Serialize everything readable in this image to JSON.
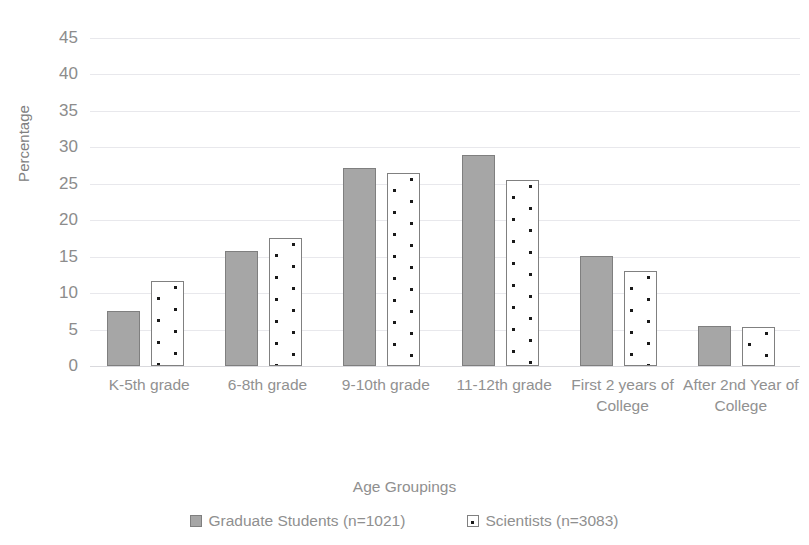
{
  "chart_data": {
    "type": "bar",
    "title": "",
    "xlabel": "Age Groupings",
    "ylabel": "Percentage",
    "ylim": [
      0,
      45
    ],
    "yticks": [
      0,
      5,
      10,
      15,
      20,
      25,
      30,
      35,
      40,
      45
    ],
    "grid": true,
    "legend_position": "bottom",
    "categories": [
      "K-5th grade",
      "6-8th grade",
      "9-10th grade",
      "11-12th grade",
      "First 2 years of College",
      "After 2nd Year of College"
    ],
    "series": [
      {
        "name": "Graduate Students (n=1021)",
        "style": "solid-gray",
        "color": "#A6A6A6",
        "values": [
          7.6,
          15.8,
          27.2,
          29.0,
          15.1,
          5.5
        ]
      },
      {
        "name": "Scientists (n=3083)",
        "style": "white-with-dots",
        "color": "#FFFFFF",
        "values": [
          11.7,
          17.6,
          26.5,
          25.5,
          13.0,
          5.3
        ]
      }
    ]
  },
  "axis": {
    "y_title": "Percentage",
    "x_title": "Age Groupings",
    "y_ticks": [
      "45",
      "40",
      "35",
      "30",
      "25",
      "20",
      "15",
      "10",
      "5",
      "0"
    ]
  },
  "x_labels": [
    "K-5th grade",
    "6-8th grade",
    "9-10th grade",
    "11-12th grade",
    "First 2 years of College",
    "After 2nd Year of College"
  ],
  "legend": {
    "items": [
      {
        "label": "Graduate Students (n=1021)"
      },
      {
        "label": "Scientists (n=3083)"
      }
    ]
  },
  "colors": {
    "series1_fill": "#A6A6A6",
    "series1_border": "#7F7F7F",
    "series2_fill": "#FFFFFF",
    "series2_border": "#808080",
    "dot": "#1A1A1A",
    "gridline": "#E8E8EC",
    "text": "#8F8F8F"
  }
}
